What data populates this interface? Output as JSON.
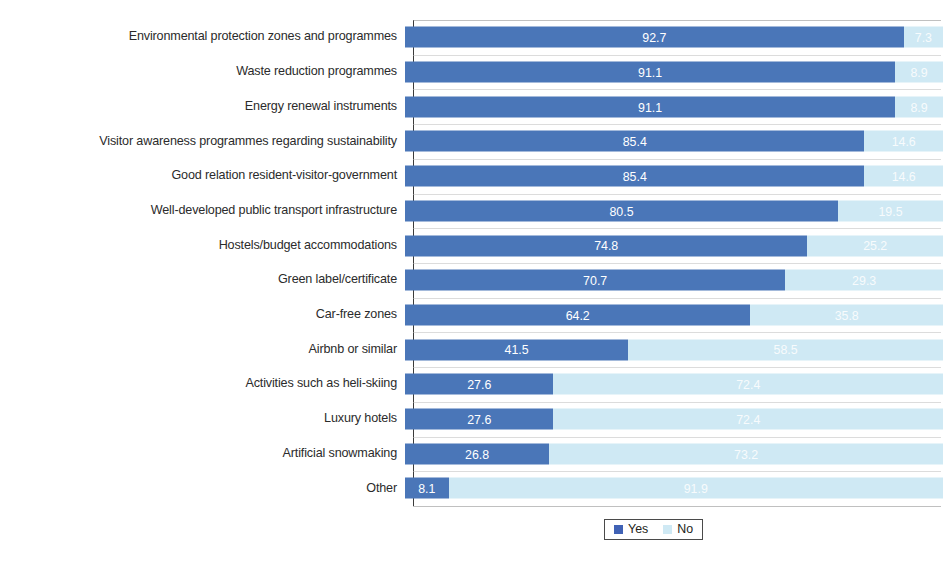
{
  "chart_data": {
    "type": "bar",
    "orientation": "horizontal",
    "stacked": true,
    "stacked_percent": true,
    "title": "",
    "subtitle": "",
    "xlabel": "",
    "ylabel": "",
    "xlim": [
      0,
      100
    ],
    "grid": true,
    "grid_axis": "y",
    "legend_position": "bottom",
    "categories": [
      "Environmental protection zones and programmes",
      "Waste reduction programmes",
      "Energy renewal instruments",
      "Visitor awareness programmes regarding sustainability",
      "Good relation resident-visitor-government",
      "Well-developed public transport infrastructure",
      "Hostels/budget accommodations",
      "Green label/certificate",
      "Car-free zones",
      "Airbnb or similar",
      "Activities such as heli-skiing",
      "Luxury hotels",
      "Artificial snowmaking",
      "Other"
    ],
    "series": [
      {
        "name": "Yes",
        "color": "#4a76b8",
        "values": [
          92.7,
          91.1,
          91.1,
          85.4,
          85.4,
          80.5,
          74.8,
          70.7,
          64.2,
          41.5,
          27.6,
          27.6,
          26.8,
          8.1
        ],
        "labels": [
          "92.7",
          "91.1",
          "91.1",
          "85.4",
          "85.4",
          "80.5",
          "74.8",
          "70.7",
          "64.2",
          "41.5",
          "27.6",
          "27.6",
          "26.8",
          "8.1"
        ]
      },
      {
        "name": "No",
        "color": "#cfe9f4",
        "values": [
          7.3,
          8.9,
          8.9,
          14.6,
          14.6,
          19.5,
          25.2,
          29.3,
          35.8,
          58.5,
          72.4,
          72.4,
          73.2,
          91.9
        ],
        "labels": [
          "7.3",
          "8.9",
          "8.9",
          "14.6",
          "14.6",
          "19.5",
          "25.2",
          "29.3",
          "35.8",
          "58.5",
          "72.4",
          "72.4",
          "73.2",
          "91.9"
        ]
      }
    ]
  },
  "legend": {
    "items": [
      {
        "label": "Yes",
        "color": "#4062b5"
      },
      {
        "label": "No",
        "color": "#cfe9f4"
      }
    ]
  }
}
